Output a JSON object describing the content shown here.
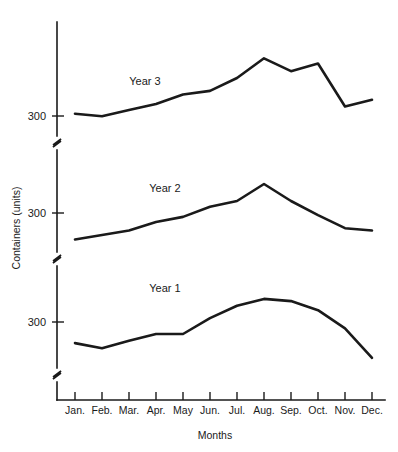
{
  "chart_data": {
    "type": "line",
    "title": "",
    "xlabel": "Months",
    "ylabel": "Containers (units)",
    "grid": false,
    "legend_position": "inline-annotation",
    "axis_note": "Y axis is broken into three stacked panels, one per year; each panel repeats the 300 tick.",
    "categories": [
      "Jan.",
      "Feb.",
      "Mar.",
      "Apr.",
      "May",
      "Jun.",
      "Jul.",
      "Aug.",
      "Sep.",
      "Oct.",
      "Nov.",
      "Dec."
    ],
    "panels": [
      {
        "name": "Year 3",
        "ytick_labels": [
          "300"
        ],
        "ytick_values": [
          300
        ],
        "ylim": [
          250,
          470
        ]
      },
      {
        "name": "Year 2",
        "ytick_labels": [
          "300"
        ],
        "ytick_values": [
          300
        ],
        "ylim": [
          250,
          430
        ]
      },
      {
        "name": "Year 1",
        "ytick_labels": [
          "300"
        ],
        "ytick_values": [
          300
        ],
        "ylim": [
          230,
          410
        ]
      }
    ],
    "series": [
      {
        "name": "Year 3",
        "values": [
          293,
          288,
          300,
          312,
          330,
          337,
          362,
          400,
          375,
          390,
          307,
          320
        ]
      },
      {
        "name": "Year 2",
        "values": [
          272,
          280,
          288,
          303,
          312,
          330,
          340,
          370,
          340,
          315,
          292,
          288
        ]
      },
      {
        "name": "Year 1",
        "values": [
          274,
          265,
          278,
          290,
          290,
          318,
          340,
          352,
          348,
          332,
          300,
          248
        ]
      }
    ]
  },
  "axes": {
    "y_title": "Containers (units)",
    "x_title": "Months",
    "y_tick_label": "300",
    "x_tick_labels": [
      "Jan.",
      "Feb.",
      "Mar.",
      "Apr.",
      "May",
      "Jun.",
      "Jul.",
      "Aug.",
      "Sep.",
      "Oct.",
      "Nov.",
      "Dec."
    ]
  },
  "annotations": {
    "year3_label": "Year 3",
    "year2_label": "Year 2",
    "year1_label": "Year 1"
  },
  "colors": {
    "ink": "#1a1a1a",
    "background": "#ffffff"
  }
}
